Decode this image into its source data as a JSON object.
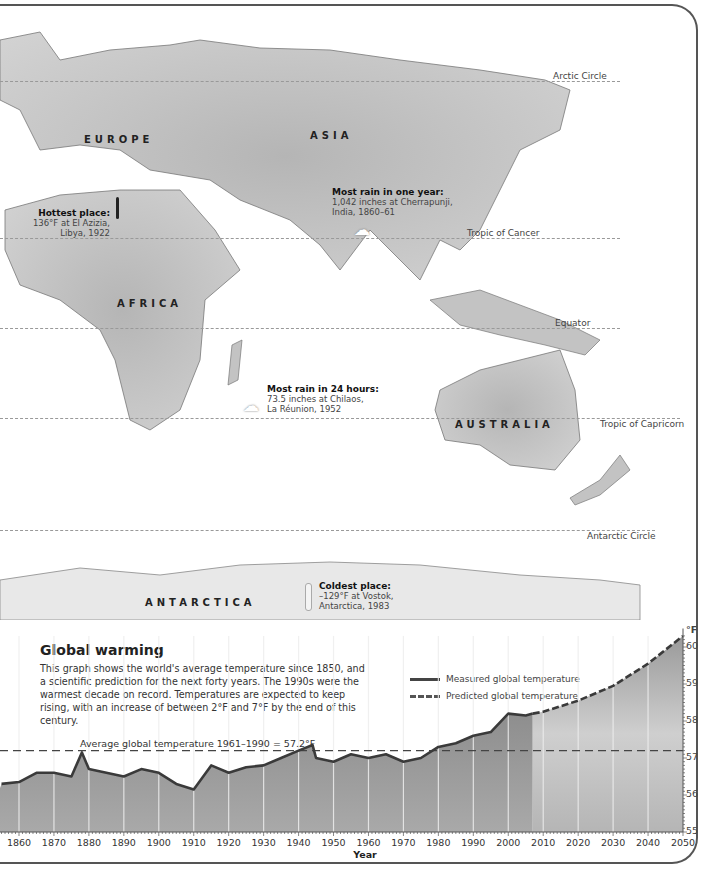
{
  "map": {
    "regions": {
      "europe": "EUROPE",
      "asia": "ASIA",
      "africa": "AFRICA",
      "australia": "AUSTRALIA",
      "antarctica": "ANTARCTICA"
    },
    "lines": {
      "arctic_circle": "Arctic Circle",
      "tropic_of_cancer": "Tropic of Cancer",
      "equator": "Equator",
      "tropic_of_capricorn": "Tropic of Capricorn",
      "antarctic_circle": "Antarctic Circle"
    },
    "callouts": {
      "hottest": {
        "title": "Hottest place:",
        "line1": "136°F at El Azizia,",
        "line2": "Libya, 1922"
      },
      "rain_year": {
        "title": "Most rain in one year:",
        "line1": "1,042 inches at Cherrapunji,",
        "line2": "India, 1860–61"
      },
      "rain_24h": {
        "title": "Most rain in 24 hours:",
        "line1": "73.5 inches at Chilaos,",
        "line2": "La Réunion, 1952"
      },
      "coldest": {
        "title": "Coldest place:",
        "line1": "–129°F at Vostok,",
        "line2": "Antarctica, 1983"
      }
    }
  },
  "chart": {
    "title": "Global warming",
    "description": "This graph shows the world's average temperature since 1850, and a scientific prediction for the next forty years. The 1990s were the warmest decade on record. Temperatures are expected to keep rising, with an increase of between 2°F and 7°F by the end of this century.",
    "legend": {
      "measured": "Measured global temperature",
      "predicted": "Predicted global temperature"
    },
    "average_label": "Average global temperature 1961–1990 = 57.2°F",
    "y_unit": "°F",
    "y_ticks": [
      "60",
      "59",
      "58",
      "57",
      "56",
      "55"
    ],
    "x_ticks": [
      "1860",
      "1870",
      "1880",
      "1890",
      "1900",
      "1910",
      "1920",
      "1930",
      "1940",
      "1950",
      "1960",
      "1970",
      "1980",
      "1990",
      "2000",
      "2010",
      "2020",
      "2030",
      "2040",
      "2050"
    ],
    "x_title": "Year"
  },
  "chart_data": {
    "type": "line",
    "title": "Global warming",
    "xlabel": "Year",
    "ylabel": "°F",
    "xlim": [
      1850,
      2050
    ],
    "ylim": [
      55,
      60.3
    ],
    "grid": "vertical lines every 10 years",
    "legend_position": "upper right",
    "x": [
      1855,
      1860,
      1865,
      1870,
      1875,
      1878,
      1880,
      1885,
      1890,
      1895,
      1900,
      1905,
      1910,
      1915,
      1920,
      1925,
      1930,
      1935,
      1940,
      1944,
      1945,
      1950,
      1955,
      1960,
      1965,
      1970,
      1975,
      1980,
      1985,
      1990,
      1995,
      2000,
      2005,
      2007
    ],
    "series": [
      {
        "name": "Measured global temperature",
        "style": "solid",
        "x": [
          1855,
          1860,
          1865,
          1870,
          1875,
          1878,
          1880,
          1885,
          1890,
          1895,
          1900,
          1905,
          1910,
          1915,
          1920,
          1925,
          1930,
          1935,
          1940,
          1944,
          1945,
          1950,
          1955,
          1960,
          1965,
          1970,
          1975,
          1980,
          1985,
          1990,
          1995,
          2000,
          2005,
          2007
        ],
        "values": [
          56.3,
          56.35,
          56.6,
          56.6,
          56.5,
          57.15,
          56.7,
          56.6,
          56.5,
          56.7,
          56.6,
          56.3,
          56.15,
          56.8,
          56.6,
          56.75,
          56.8,
          57.0,
          57.2,
          57.35,
          57.0,
          56.9,
          57.1,
          57.0,
          57.1,
          56.9,
          57.0,
          57.3,
          57.4,
          57.6,
          57.7,
          58.2,
          58.15,
          58.2
        ]
      },
      {
        "name": "Predicted global temperature",
        "style": "dashed",
        "x": [
          2007,
          2010,
          2020,
          2030,
          2040,
          2050
        ],
        "values": [
          58.2,
          58.25,
          58.55,
          58.95,
          59.55,
          60.3
        ]
      },
      {
        "name": "Average global temperature 1961–1990",
        "style": "dashed-reference",
        "x": [
          1850,
          2050
        ],
        "values": [
          57.2,
          57.2
        ]
      }
    ],
    "annotations": [
      "Average global temperature 1961–1990 = 57.2°F"
    ]
  }
}
